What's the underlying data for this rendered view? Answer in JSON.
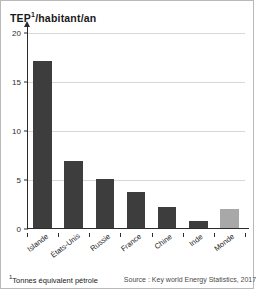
{
  "chart_data": {
    "type": "bar",
    "title_main": "TEP",
    "title_sup": "1",
    "title_rest": "/habitant/an",
    "xlabel": "",
    "ylabel": "TEP¹/habitant/an",
    "ylim": [
      0,
      20
    ],
    "yticks": [
      0,
      5,
      10,
      15,
      20
    ],
    "ytick_labels": [
      "0",
      "5",
      "10",
      "15",
      "20"
    ],
    "grid": true,
    "legend": "none",
    "categories": [
      "Islande",
      "États-Unis",
      "Russie",
      "France",
      "Chine",
      "Inde",
      "Monde"
    ],
    "values": [
      17.0,
      6.8,
      5.0,
      3.7,
      2.1,
      0.7,
      1.9
    ],
    "bar_colors": [
      "#3d3d3d",
      "#3d3d3d",
      "#3d3d3d",
      "#3d3d3d",
      "#3d3d3d",
      "#3d3d3d",
      "#a8a8a8"
    ],
    "highlight_category": "Monde",
    "highlight_color": "#a8a8a8",
    "series_color": "#3d3d3d"
  },
  "footer": {
    "footnote_marker": "1",
    "footnote_text": "Tonnes équivalent pétrole",
    "source": "Source : Key world Energy Statistics, 2017."
  }
}
